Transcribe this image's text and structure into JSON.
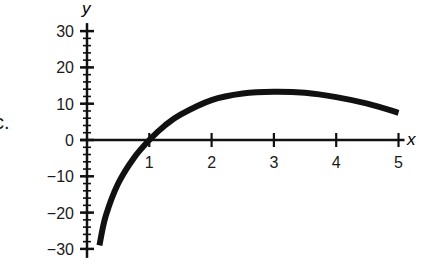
{
  "part_label": "c.",
  "chart_data": {
    "type": "line",
    "title": "",
    "xlabel": "x",
    "ylabel": "y",
    "xlim": [
      0,
      5
    ],
    "ylim": [
      -30,
      30
    ],
    "x_ticks": [
      1,
      2,
      3,
      4,
      5
    ],
    "y_ticks": [
      30,
      20,
      10,
      0,
      -10,
      -20,
      -30
    ],
    "y_tick_labels": [
      "30",
      "20",
      "10",
      "0",
      "−10",
      "−20",
      "−30"
    ],
    "y_minor_step": 2,
    "grid": false,
    "legend": null,
    "series": [
      {
        "name": "f(x)",
        "x": [
          0.2,
          0.3,
          0.5,
          0.75,
          1.0,
          1.25,
          1.5,
          2.0,
          2.5,
          3.0,
          3.5,
          4.0,
          4.5,
          5.0
        ],
        "y": [
          -29,
          -21,
          -12,
          -5,
          0,
          4,
          7,
          11,
          12.8,
          13.3,
          13,
          11.8,
          10,
          7.5
        ]
      }
    ]
  }
}
